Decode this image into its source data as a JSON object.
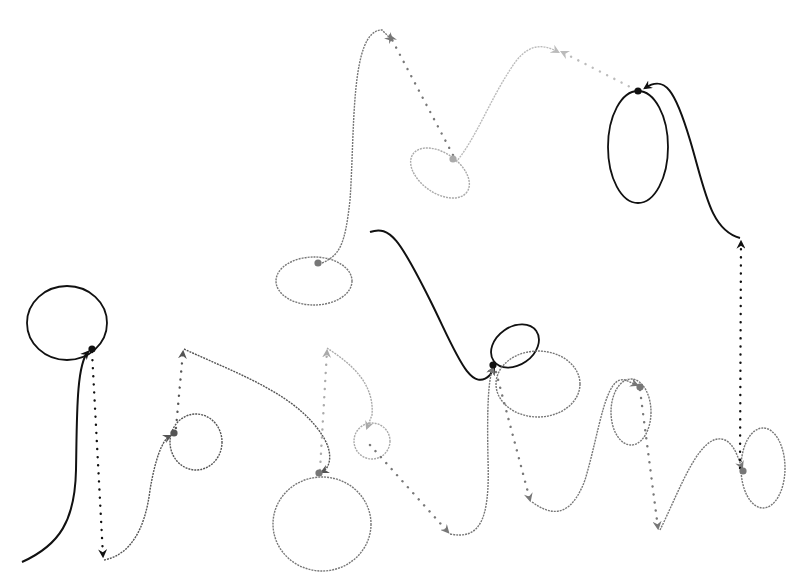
{
  "diagram": {
    "title": "",
    "width": 803,
    "height": 587,
    "background": "#ffffff",
    "shades": {
      "black": "#111111",
      "dark": "#555555",
      "mid": "#777777",
      "light": "#aaaaaa",
      "faint": "#bbbbbb"
    },
    "loops": [
      {
        "id": "loop-1",
        "cx": 67,
        "cy": 323,
        "rx": 40,
        "ry": 37,
        "rot": 0,
        "shade": "black",
        "dashed": false
      },
      {
        "id": "loop-2",
        "cx": 196,
        "cy": 442,
        "rx": 26,
        "ry": 28,
        "rot": 0,
        "shade": "dark",
        "dashed": true
      },
      {
        "id": "loop-3",
        "cx": 314,
        "cy": 281,
        "rx": 38,
        "ry": 24,
        "rot": 0,
        "shade": "mid",
        "dashed": true
      },
      {
        "id": "loop-4",
        "cx": 440,
        "cy": 173,
        "rx": 33,
        "ry": 20,
        "rot": 35,
        "shade": "light",
        "dashed": true
      },
      {
        "id": "loop-5",
        "cx": 638,
        "cy": 147,
        "rx": 30,
        "ry": 56,
        "rot": 0,
        "shade": "black",
        "dashed": false
      },
      {
        "id": "loop-6",
        "cx": 322,
        "cy": 524,
        "rx": 49,
        "ry": 47,
        "rot": 0,
        "shade": "mid",
        "dashed": true
      },
      {
        "id": "loop-7",
        "cx": 372,
        "cy": 441,
        "rx": 18,
        "ry": 18,
        "rot": 0,
        "shade": "light",
        "dashed": true
      },
      {
        "id": "loop-8",
        "cx": 515,
        "cy": 346,
        "rx": 26,
        "ry": 19,
        "rot": -35,
        "shade": "black",
        "dashed": false
      },
      {
        "id": "loop-9",
        "cx": 538,
        "cy": 384,
        "rx": 42,
        "ry": 33,
        "rot": 0,
        "shade": "mid",
        "dashed": true
      },
      {
        "id": "loop-10",
        "cx": 631,
        "cy": 412,
        "rx": 20,
        "ry": 33,
        "rot": 0,
        "shade": "mid",
        "dashed": true
      },
      {
        "id": "loop-11",
        "cx": 763,
        "cy": 468,
        "rx": 22,
        "ry": 40,
        "rot": 0,
        "shade": "mid",
        "dashed": true
      }
    ],
    "nodes": [
      {
        "id": "node-1",
        "x": 92,
        "y": 349,
        "shade": "black"
      },
      {
        "id": "node-2",
        "x": 174,
        "y": 433,
        "shade": "dark"
      },
      {
        "id": "node-3",
        "x": 318,
        "y": 263,
        "shade": "mid"
      },
      {
        "id": "node-4",
        "x": 453,
        "y": 159,
        "shade": "light"
      },
      {
        "id": "node-5",
        "x": 638,
        "y": 91,
        "shade": "black"
      },
      {
        "id": "node-6",
        "x": 319,
        "y": 473,
        "shade": "mid"
      },
      {
        "id": "node-7",
        "x": 493,
        "y": 365,
        "shade": "black"
      },
      {
        "id": "node-8",
        "x": 640,
        "y": 387,
        "shade": "mid"
      },
      {
        "id": "node-9",
        "x": 743,
        "y": 471,
        "shade": "mid"
      }
    ],
    "curves": [
      {
        "id": "curve-1",
        "d": "M 22 562 C 60 545, 75 520, 76 470 C 77 420, 76 365, 88 352",
        "shade": "black",
        "dashed": false,
        "arrow_at_end": true
      },
      {
        "id": "curve-2",
        "d": "M 104 560 C 130 555, 145 530, 150 490 C 155 460, 162 440, 170 436",
        "shade": "dark",
        "dashed": true,
        "arrow_at_end": true
      },
      {
        "id": "curve-3",
        "d": "M 184 349 C 240 375, 300 395, 325 440 C 333 455, 330 468, 322 472",
        "shade": "dark",
        "dashed": true,
        "arrow_at_end": true
      },
      {
        "id": "curve-4",
        "d": "M 327 348 C 345 360, 375 380, 372 415 L 367 428",
        "shade": "light",
        "dashed": true,
        "arrow_at_end": true
      },
      {
        "id": "curve-5",
        "d": "M 322 263 C 340 255, 345 245, 350 200 C 355 130, 350 30, 382 30 L 392 40",
        "shade": "mid",
        "dashed": true,
        "arrow_at_end": true
      },
      {
        "id": "curve-6",
        "d": "M 370 232 C 390 225, 400 240, 430 300 C 455 350, 470 395, 490 375 L 494 368",
        "shade": "black",
        "dashed": false,
        "arrow_at_end": true,
        "arrow_at_start": true
      },
      {
        "id": "curve-7",
        "d": "M 456 162 C 475 140, 490 100, 510 70 C 525 45, 540 42, 558 52",
        "shade": "faint",
        "dashed": true,
        "arrow_at_end": true
      },
      {
        "id": "curve-8",
        "d": "M 740 238 C 710 230, 705 190, 690 140 C 675 90, 665 75, 645 88",
        "shade": "black",
        "dashed": false,
        "arrow_at_end": true
      },
      {
        "id": "curve-9",
        "d": "M 450 534 C 480 540, 490 520, 488 460 C 487 410, 488 380, 493 368",
        "shade": "mid",
        "dashed": true,
        "arrow_at_end": true
      },
      {
        "id": "curve-10",
        "d": "M 532 502 C 550 515, 570 520, 585 480 C 600 430, 605 375, 625 380 L 637 385",
        "shade": "mid",
        "dashed": true,
        "arrow_at_end": true
      },
      {
        "id": "curve-11",
        "d": "M 660 530 C 680 490, 700 430, 725 440 C 735 445, 738 458, 742 468",
        "shade": "mid",
        "dashed": true,
        "arrow_at_end": true
      }
    ],
    "dotted_arrows": [
      {
        "id": "dots-1",
        "x1": 92,
        "y1": 352,
        "x2": 103,
        "y2": 556,
        "shade": "black",
        "label": "node-1 to bottom"
      },
      {
        "id": "dots-2",
        "x1": 176,
        "y1": 428,
        "x2": 183,
        "y2": 352,
        "shade": "dark",
        "label": "node-2 up"
      },
      {
        "id": "dots-3",
        "x1": 320,
        "y1": 470,
        "x2": 327,
        "y2": 351,
        "shade": "light",
        "label": "node-6 up"
      },
      {
        "id": "dots-4",
        "x1": 453,
        "y1": 155,
        "x2": 390,
        "y2": 36,
        "shade": "mid",
        "label": "node-4 to peak"
      },
      {
        "id": "dots-5",
        "x1": 636,
        "y1": 90,
        "x2": 562,
        "y2": 52,
        "shade": "faint",
        "label": "node-5 to left peak"
      },
      {
        "id": "dots-6",
        "x1": 740,
        "y1": 468,
        "x2": 741,
        "y2": 242,
        "shade": "black",
        "label": "node-9 up"
      },
      {
        "id": "dots-7",
        "x1": 370,
        "y1": 445,
        "x2": 448,
        "y2": 532,
        "shade": "mid",
        "label": "loop-7 down"
      },
      {
        "id": "dots-8",
        "x1": 496,
        "y1": 372,
        "x2": 530,
        "y2": 500,
        "shade": "mid",
        "label": "node-7 down"
      },
      {
        "id": "dots-9",
        "x1": 640,
        "y1": 390,
        "x2": 658,
        "y2": 528,
        "shade": "mid",
        "label": "node-8 down"
      }
    ]
  }
}
